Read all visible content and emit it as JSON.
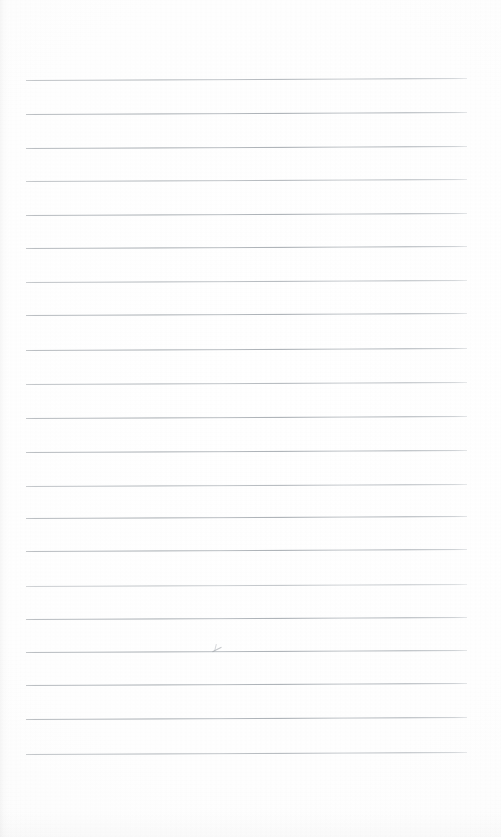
{
  "document": {
    "kind": "lined-notepaper-scan",
    "title": "Blank Lined Paper",
    "width": 501,
    "height": 837,
    "background_color": "#fdfdfd",
    "rule_color": "#b0b5ba",
    "content_text": "",
    "notes": "Blank ruled writing sheet with no handwriting or printed text."
  },
  "layout": {
    "margin_left": 26,
    "margin_right": 34,
    "margin_top": 80,
    "margin_bottom": 83,
    "line_count": 21,
    "line_spacing": 33.7,
    "line_length": 441,
    "first_line_y": 80,
    "last_line_y": 754,
    "tilt_degrees": -0.26
  },
  "rules": [
    {
      "index": 1,
      "y": 80,
      "weight": "soft"
    },
    {
      "index": 2,
      "y": 114,
      "weight": "normal"
    },
    {
      "index": 3,
      "y": 148,
      "weight": "normal"
    },
    {
      "index": 4,
      "y": 181,
      "weight": "soft"
    },
    {
      "index": 5,
      "y": 215,
      "weight": "normal"
    },
    {
      "index": 6,
      "y": 248,
      "weight": "normal"
    },
    {
      "index": 7,
      "y": 282,
      "weight": "soft"
    },
    {
      "index": 8,
      "y": 315,
      "weight": "normal"
    },
    {
      "index": 9,
      "y": 350,
      "weight": "normal"
    },
    {
      "index": 10,
      "y": 384,
      "weight": "soft"
    },
    {
      "index": 11,
      "y": 418,
      "weight": "normal"
    },
    {
      "index": 12,
      "y": 452,
      "weight": "normal"
    },
    {
      "index": 13,
      "y": 486,
      "weight": "soft"
    },
    {
      "index": 14,
      "y": 518,
      "weight": "normal"
    },
    {
      "index": 15,
      "y": 551,
      "weight": "normal"
    },
    {
      "index": 16,
      "y": 586,
      "weight": "faint"
    },
    {
      "index": 17,
      "y": 619,
      "weight": "normal"
    },
    {
      "index": 18,
      "y": 652,
      "weight": "normal"
    },
    {
      "index": 19,
      "y": 685,
      "weight": "normal"
    },
    {
      "index": 20,
      "y": 719,
      "weight": "normal"
    },
    {
      "index": 21,
      "y": 754,
      "weight": "soft"
    }
  ],
  "marks": [
    {
      "name": "pencil-smudge",
      "x": 210,
      "y": 643,
      "description": "faint stray pencil stroke above line 18"
    }
  ]
}
